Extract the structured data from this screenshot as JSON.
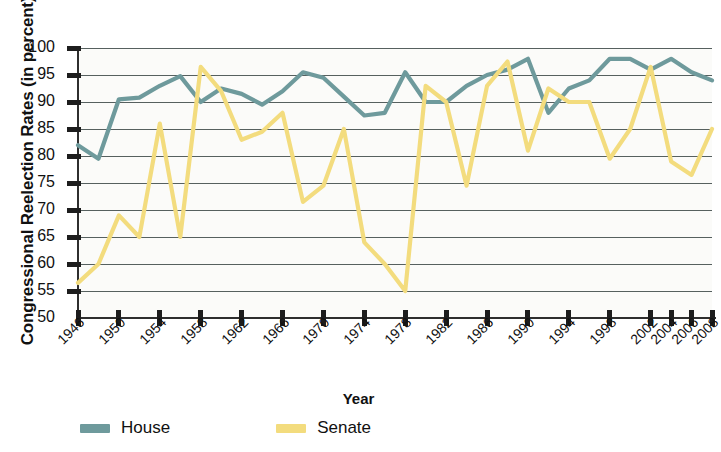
{
  "chart_data": {
    "type": "line",
    "title": "",
    "xlabel": "Year",
    "ylabel": "Congressional Reelection Rates (in percent)",
    "ylim": [
      50,
      100
    ],
    "ytick_values": [
      50,
      55,
      60,
      65,
      70,
      75,
      80,
      85,
      90,
      95,
      100
    ],
    "ytick_labels": [
      "50",
      "55",
      "60",
      "65",
      "70",
      "75",
      "80",
      "85",
      "90",
      "95",
      "100"
    ],
    "grid": true,
    "grid_axis": "y",
    "legend_position": "bottom-left",
    "x": [
      1946,
      1948,
      1950,
      1952,
      1954,
      1956,
      1958,
      1960,
      1962,
      1964,
      1966,
      1968,
      1970,
      1972,
      1974,
      1976,
      1978,
      1980,
      1982,
      1984,
      1986,
      1988,
      1990,
      1992,
      1994,
      1996,
      1998,
      2000,
      2002,
      2004,
      2006,
      2008
    ],
    "xtick_labels": [
      "1946",
      "1950",
      "1954",
      "1958",
      "1962",
      "1966",
      "1970",
      "1974",
      "1978",
      "1982",
      "1986",
      "1990",
      "1994",
      "1998",
      "2002",
      "2004",
      "2006",
      "2008"
    ],
    "xtick_values": [
      1946,
      1950,
      1954,
      1958,
      1962,
      1966,
      1970,
      1974,
      1978,
      1982,
      1986,
      1990,
      1994,
      1998,
      2002,
      2004,
      2006,
      2008
    ],
    "series": [
      {
        "name": "House",
        "color": "#6E9A9C",
        "values": [
          82,
          79.5,
          90.5,
          90.8,
          93,
          94.8,
          90,
          92.5,
          91.5,
          89.5,
          92,
          95.5,
          94.5,
          91,
          87.5,
          88,
          95.5,
          90,
          90,
          93,
          95,
          96,
          98,
          88,
          92.5,
          94,
          98,
          98,
          96,
          98,
          95.5,
          94
        ]
      },
      {
        "name": "Senate",
        "color": "#F3DC7E",
        "values": [
          56.5,
          60,
          69,
          65,
          86,
          65,
          96.5,
          92,
          83,
          84.5,
          88,
          71.5,
          74.5,
          85,
          64,
          60,
          55,
          93,
          90,
          74.5,
          93,
          97.5,
          81,
          92.5,
          90,
          90,
          79.5,
          85,
          96.5,
          79,
          76.5,
          85
        ]
      }
    ]
  },
  "legend": {
    "house_label": "House",
    "senate_label": "Senate"
  },
  "axes": {
    "x_title": "Year",
    "y_title": "Congressional Reelection Rates (in percent)"
  }
}
